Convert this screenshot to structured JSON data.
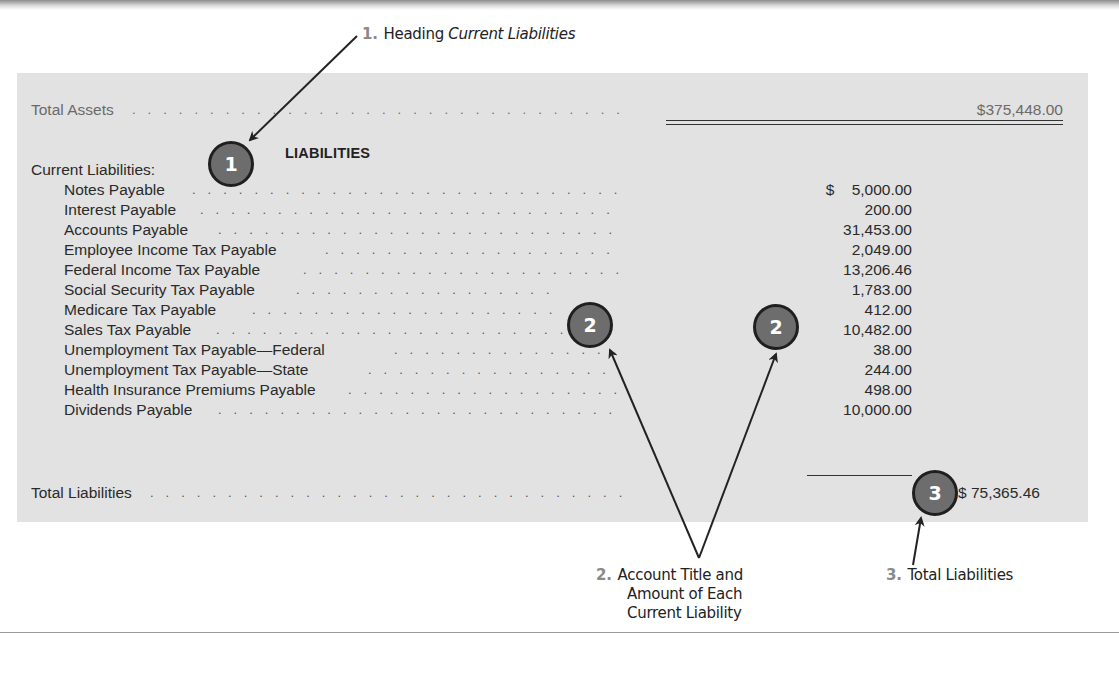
{
  "statement": {
    "total_assets": {
      "label": "Total Assets",
      "amount": "$375,448.00"
    },
    "section_heading": "LIABILITIES",
    "current_liabilities_label": "Current Liabilities:",
    "items": [
      {
        "label": "Notes Payable",
        "amount": "$    5,000.00"
      },
      {
        "label": "Interest Payable",
        "amount": "200.00"
      },
      {
        "label": "Accounts Payable",
        "amount": "31,453.00"
      },
      {
        "label": "Employee Income Tax Payable",
        "amount": "2,049.00"
      },
      {
        "label": "Federal Income Tax Payable",
        "amount": "13,206.46"
      },
      {
        "label": "Social Security Tax Payable",
        "amount": "1,783.00"
      },
      {
        "label": "Medicare Tax Payable",
        "amount": "412.00"
      },
      {
        "label": "Sales Tax Payable",
        "amount": "10,482.00"
      },
      {
        "label": "Unemployment Tax Payable—Federal",
        "amount": "38.00"
      },
      {
        "label": "Unemployment Tax Payable—State",
        "amount": "244.00"
      },
      {
        "label": "Health Insurance Premiums Payable",
        "amount": "498.00"
      },
      {
        "label": "Dividends Payable",
        "amount": "10,000.00"
      }
    ],
    "total_liabilities": {
      "label": "Total Liabilities",
      "amount": "$ 75,365.46"
    }
  },
  "markers": [
    {
      "number": "1"
    },
    {
      "number": "2"
    },
    {
      "number": "2"
    },
    {
      "number": "3"
    }
  ],
  "callouts": {
    "one": {
      "number": "1.",
      "text": "Heading ",
      "italic": "Current Liabilities"
    },
    "two": {
      "number": "2.",
      "line1": "Account Title and",
      "line2": "Amount of Each",
      "line3": "Current Liability"
    },
    "three": {
      "number": "3.",
      "text": "Total Liabilities"
    }
  },
  "colors": {
    "panel": "#e2e2e2",
    "marker_fill": "#6d6d6d",
    "marker_border": "#1f1f1f",
    "callout_number": "#8a8a8a"
  },
  "leader_dots": ". . . . . . . . . . . . . . . . . . . . . . . . . . . . . . . . . . . . . . . . . . . . . . . . . . . . . . . . . . . . . . . . . . . . . . . . . . . . . . . . . ."
}
